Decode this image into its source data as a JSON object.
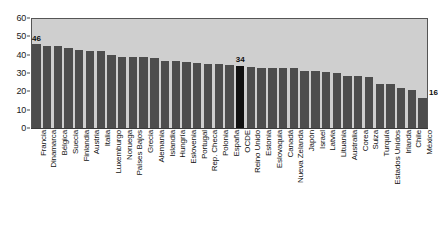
{
  "chart_data": {
    "type": "bar",
    "title": "",
    "subtitle": "",
    "xlabel": "",
    "ylabel": "",
    "ylim": [
      0,
      60
    ],
    "ytick_values": [
      0,
      10,
      20,
      30,
      40,
      50,
      60
    ],
    "ytick_labels": [
      "0",
      "10",
      "20",
      "30",
      "40",
      "50",
      "60"
    ],
    "grid": false,
    "legend": null,
    "highlight_category": "OCDE",
    "colors": {
      "bar": "#4d4d4d",
      "bar_highlight": "#111111",
      "plot_background": "#cfcfcf",
      "axis": "#555555",
      "text": "#111111",
      "page_background": "#ffffff"
    },
    "categories": [
      "Francia",
      "Dinamarca",
      "Bélgica",
      "Suecia",
      "Finlandia",
      "Austria",
      "Italia",
      "Luxemburgo",
      "Noruega",
      "Países Bajos",
      "Grecia",
      "Alemania",
      "Islandia",
      "Hungría",
      "Eslovenia",
      "Portugal",
      "Rep. Checa",
      "Polonia",
      "España",
      "OCDE",
      "Reino Unido",
      "Estonia",
      "Eslovaquia",
      "Canadá",
      "Nueva Zelanda",
      "Japón",
      "Israel",
      "Latvia",
      "Lituania",
      "Australia",
      "Corea",
      "Suiza",
      "Turquía",
      "Estados Unidos",
      "Irlanda",
      "Chile",
      "México"
    ],
    "values": [
      45.8,
      44.6,
      44.5,
      43.7,
      42.4,
      42.0,
      42.0,
      39.7,
      38.8,
      38.5,
      38.5,
      38.0,
      36.5,
      36.5,
      36.2,
      35.4,
      35.0,
      34.7,
      34.3,
      34.0,
      33.4,
      33.0,
      32.9,
      32.8,
      32.5,
      31.2,
      30.9,
      30.4,
      30.1,
      28.2,
      28.1,
      27.6,
      24.1,
      24.1,
      21.6,
      20.5,
      16.2
    ],
    "point_labels": [
      {
        "category": "Francia",
        "text": "46"
      },
      {
        "category": "OCDE",
        "text": "34"
      },
      {
        "category": "México",
        "text": "16"
      }
    ]
  }
}
